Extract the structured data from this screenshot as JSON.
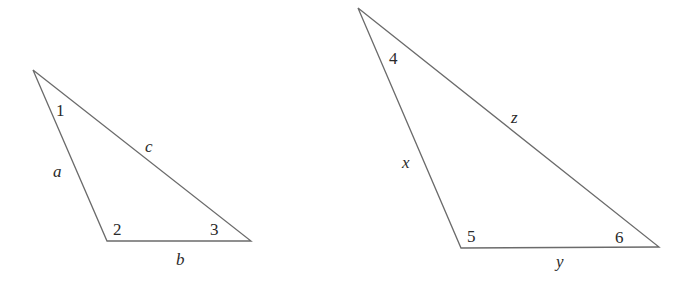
{
  "diagram": {
    "triangles": [
      {
        "id": "left",
        "vertices": [
          [
            33,
            70
          ],
          [
            107,
            241
          ],
          [
            251,
            241
          ]
        ],
        "angles": [
          {
            "label": "1",
            "x": 56,
            "y": 116
          },
          {
            "label": "2",
            "x": 113,
            "y": 235
          },
          {
            "label": "3",
            "x": 210,
            "y": 235
          }
        ],
        "sides": [
          {
            "label": "a",
            "x": 53,
            "y": 177
          },
          {
            "label": "c",
            "x": 145,
            "y": 152
          },
          {
            "label": "b",
            "x": 176,
            "y": 265
          }
        ]
      },
      {
        "id": "right",
        "vertices": [
          [
            358,
            8
          ],
          [
            461,
            248
          ],
          [
            659,
            247
          ]
        ],
        "angles": [
          {
            "label": "4",
            "x": 389,
            "y": 64
          },
          {
            "label": "5",
            "x": 467,
            "y": 242
          },
          {
            "label": "6",
            "x": 615,
            "y": 243
          }
        ],
        "sides": [
          {
            "label": "x",
            "x": 402,
            "y": 168
          },
          {
            "label": "z",
            "x": 511,
            "y": 123
          },
          {
            "label": "y",
            "x": 556,
            "y": 267
          }
        ]
      }
    ],
    "colors": {
      "stroke": "#6b6b6b",
      "text": "#2a2a2a",
      "background": "#ffffff"
    }
  }
}
